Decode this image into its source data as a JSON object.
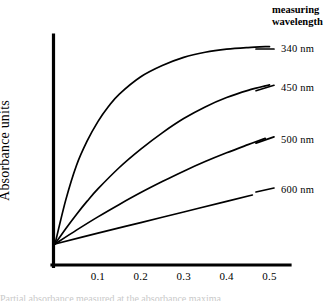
{
  "chart_data": {
    "type": "line",
    "title": "",
    "xlabel": "",
    "ylabel": "Absorbance units",
    "xlim": [
      0,
      0.555
    ],
    "ylim": [
      0,
      1.0
    ],
    "grid": false,
    "legend_position": "right",
    "legend_title": "measuring wavelength",
    "legend_title_line1": "measuring",
    "legend_title_line2": "wavelength",
    "xticks": [
      "0.1",
      "0.2",
      "0.3",
      "0.4",
      "0.5"
    ],
    "xtick_values": [
      0.1,
      0.2,
      0.3,
      0.4,
      0.5
    ],
    "yticks": [],
    "axis_color": "#000000",
    "curve_color": "#000000",
    "series": [
      {
        "name": "340 nm",
        "label": "340 nm",
        "x": [
          0.0,
          0.025,
          0.05,
          0.075,
          0.1,
          0.125,
          0.15,
          0.2,
          0.25,
          0.3,
          0.35,
          0.4,
          0.45,
          0.5
        ],
        "y": [
          0.0,
          0.215,
          0.385,
          0.505,
          0.6,
          0.675,
          0.735,
          0.82,
          0.875,
          0.915,
          0.94,
          0.955,
          0.963,
          0.968
        ]
      },
      {
        "name": "450 nm",
        "label": "450 nm",
        "x": [
          0.0,
          0.025,
          0.05,
          0.075,
          0.1,
          0.15,
          0.2,
          0.25,
          0.3,
          0.35,
          0.4,
          0.45,
          0.5
        ],
        "y": [
          0.0,
          0.075,
          0.145,
          0.21,
          0.27,
          0.375,
          0.465,
          0.545,
          0.615,
          0.672,
          0.718,
          0.753,
          0.78
        ]
      },
      {
        "name": "500 nm",
        "label": "500 nm",
        "x": [
          0.0,
          0.05,
          0.1,
          0.15,
          0.2,
          0.25,
          0.3,
          0.35,
          0.4,
          0.45,
          0.49
        ],
        "y": [
          0.0,
          0.068,
          0.133,
          0.194,
          0.252,
          0.306,
          0.357,
          0.404,
          0.447,
          0.487,
          0.518
        ]
      },
      {
        "name": "600 nm",
        "label": "600 nm",
        "x": [
          0.0,
          0.1,
          0.2,
          0.3,
          0.4,
          0.46
        ],
        "y": [
          0.0,
          0.053,
          0.105,
          0.157,
          0.209,
          0.24
        ]
      }
    ]
  },
  "axis": {
    "y_title": "Absorbance units"
  },
  "bottom_caption": {
    "text": "Partial absorbance measured at the absorbance maxima"
  }
}
